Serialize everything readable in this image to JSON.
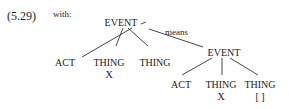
{
  "example": {
    "number": "(5.29)",
    "intro": "with:"
  },
  "tree": {
    "root": "EVENT",
    "root_children": [
      "ACT",
      "THING",
      "THING"
    ],
    "root_child_sub": [
      "",
      "X",
      ""
    ],
    "edge_label": "means",
    "sub_root": "EVENT",
    "sub_children": [
      "ACT",
      "THING",
      "THING"
    ],
    "sub_child_sub": [
      "",
      "X",
      "[ ]"
    ]
  }
}
